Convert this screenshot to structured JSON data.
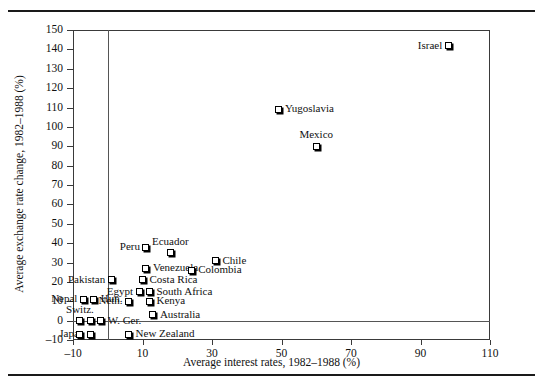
{
  "figure": {
    "top_rule": "",
    "bottom_rule": ""
  },
  "chart_data": {
    "type": "scatter",
    "title": "",
    "xlabel": "Average interest rates, 1982–1988 (%)",
    "ylabel": "Average exchange rate change, 1982–1988 (%)",
    "xlim": [
      -10,
      110
    ],
    "ylim": [
      -10,
      150
    ],
    "xticks": [
      -10,
      10,
      30,
      50,
      70,
      90,
      110
    ],
    "xtick_labels": [
      "–10",
      "10",
      "30",
      "50",
      "70",
      "90",
      "110"
    ],
    "yticks": [
      -10,
      0,
      10,
      20,
      30,
      40,
      50,
      60,
      70,
      80,
      90,
      100,
      110,
      120,
      130,
      140,
      150
    ],
    "ytick_labels": [
      "–10",
      "0",
      "10",
      "20",
      "30",
      "40",
      "50",
      "60",
      "70",
      "80",
      "90",
      "100",
      "110",
      "120",
      "130",
      "140",
      "150"
    ],
    "grid": false,
    "legend": null,
    "reference_lines": [
      {
        "axis": "y",
        "value": 0
      },
      {
        "axis": "x",
        "value": 0
      }
    ],
    "points": [
      {
        "label": "Israel",
        "x": 98,
        "y": 142,
        "label_pos": "left"
      },
      {
        "label": "Yugoslavia",
        "x": 49,
        "y": 109,
        "label_pos": "right"
      },
      {
        "label": "Mexico",
        "x": 60,
        "y": 90,
        "label_pos": "above"
      },
      {
        "label": "Peru",
        "x": 11,
        "y": 38,
        "label_pos": "left"
      },
      {
        "label": "Ecuador",
        "x": 18,
        "y": 35,
        "label_pos": "above"
      },
      {
        "label": "Chile",
        "x": 31,
        "y": 31,
        "label_pos": "right"
      },
      {
        "label": "Venezuela",
        "x": 11,
        "y": 27,
        "label_pos": "right"
      },
      {
        "label": "Colombia",
        "x": 24,
        "y": 26,
        "label_pos": "right"
      },
      {
        "label": "Pakistan",
        "x": 1,
        "y": 21,
        "label_pos": "left"
      },
      {
        "label": "Costa Rica",
        "x": 10,
        "y": 21,
        "label_pos": "right"
      },
      {
        "label": "Egypt",
        "x": 9,
        "y": 15,
        "label_pos": "left"
      },
      {
        "label": "South Africa",
        "x": 12,
        "y": 15,
        "label_pos": "right"
      },
      {
        "label": "Nepal",
        "x": -7,
        "y": 11,
        "label_pos": "left"
      },
      {
        "label": "Hun.",
        "x": -4,
        "y": 11,
        "label_pos": "right"
      },
      {
        "label": "Neth.",
        "x": 6,
        "y": 10,
        "label_pos": "left"
      },
      {
        "label": "Kenya",
        "x": 12,
        "y": 10,
        "label_pos": "right"
      },
      {
        "label": "Australia",
        "x": 13,
        "y": 3,
        "label_pos": "right"
      },
      {
        "label": "Switz.",
        "x": -8,
        "y": 0,
        "label_pos": "above"
      },
      {
        "label": "W. Ger.",
        "x": -2,
        "y": 0,
        "label_pos": "right"
      },
      {
        "label": "Japan",
        "x": -5,
        "y": -7,
        "label_pos": "left"
      },
      {
        "label": "New Zealand",
        "x": 6,
        "y": -7,
        "label_pos": "right"
      }
    ],
    "extra_markers": [
      {
        "x": -5,
        "y": 0
      },
      {
        "x": -8,
        "y": -7
      }
    ]
  }
}
